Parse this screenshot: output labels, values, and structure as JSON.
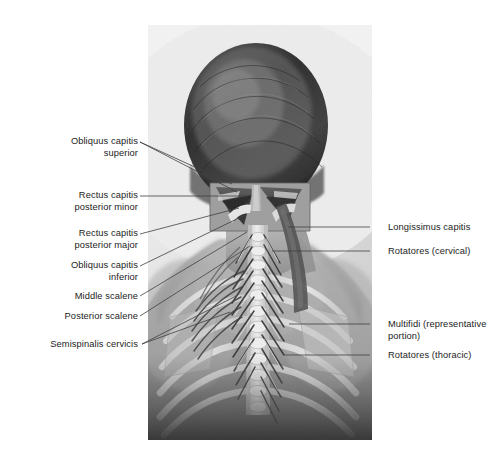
{
  "figure": {
    "kind": "anatomical-photograph",
    "view": "posterior view of head, neck and upper back",
    "background_color": "#ffffff",
    "panel_color": "#e9e9e9",
    "text_color": "#1c1c1c",
    "leader_color": "#404040"
  },
  "labels_left": [
    {
      "id": "obliquus-capitis-superior",
      "text": "Obliquus capitis\nsuperior",
      "x": 18,
      "y": 136,
      "w": 120,
      "leaders": [
        [
          140,
          142,
          232,
          184
        ],
        [
          140,
          142,
          237,
          192
        ]
      ]
    },
    {
      "id": "rectus-capitis-posterior-minor",
      "text": "Rectus capitis\nposterior minor",
      "x": 18,
      "y": 190,
      "w": 120,
      "leaders": [
        [
          140,
          196,
          248,
          196
        ]
      ]
    },
    {
      "id": "rectus-capitis-posterior-major",
      "text": "Rectus capitis\nposterior major",
      "x": 18,
      "y": 228,
      "w": 120,
      "leaders": [
        [
          140,
          234,
          239,
          208
        ]
      ]
    },
    {
      "id": "obliquus-capitis-inferior",
      "text": "Obliquus capitis\ninferior",
      "x": 18,
      "y": 260,
      "w": 120,
      "leaders": [
        [
          140,
          266,
          243,
          216
        ]
      ]
    },
    {
      "id": "middle-scalene",
      "text": "Middle scalene",
      "x": 18,
      "y": 291,
      "w": 120,
      "leaders": [
        [
          140,
          296,
          247,
          232
        ]
      ]
    },
    {
      "id": "posterior-scalene",
      "text": "Posterior scalene",
      "x": 18,
      "y": 311,
      "w": 120,
      "leaders": [
        [
          140,
          316,
          250,
          246
        ]
      ]
    },
    {
      "id": "semispinalis-cervicis",
      "text": "Semispinalis cervicis",
      "x": 12,
      "y": 339,
      "w": 126,
      "leaders": [
        [
          142,
          344,
          236,
          296
        ],
        [
          142,
          344,
          230,
          312
        ]
      ]
    }
  ],
  "labels_right": [
    {
      "id": "longissimus-capitis",
      "text": "Longissimus capitis",
      "x": 388,
      "y": 222,
      "w": 110,
      "leaders": [
        [
          370,
          227,
          288,
          227
        ]
      ]
    },
    {
      "id": "rotatores-cervical",
      "text": "Rotatores (cervical)",
      "x": 388,
      "y": 246,
      "w": 110,
      "leaders": [
        [
          370,
          251,
          272,
          251
        ]
      ]
    },
    {
      "id": "multifidi-representative-portion",
      "text": "Multifidi (representative\nportion)",
      "x": 388,
      "y": 319,
      "w": 112,
      "leaders": [
        [
          370,
          324,
          289,
          324
        ]
      ]
    },
    {
      "id": "rotatores-thoracic",
      "text": "Rotatores (thoracic)",
      "x": 388,
      "y": 350,
      "w": 112,
      "leaders": [
        [
          370,
          355,
          285,
          355
        ]
      ]
    }
  ]
}
